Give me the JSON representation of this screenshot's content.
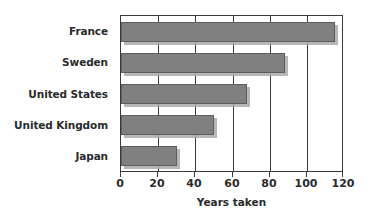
{
  "chart_data": {
    "type": "bar",
    "orientation": "horizontal",
    "title": "",
    "xlabel": "Years taken",
    "ylabel": "",
    "categories": [
      "France",
      "Sweden",
      "United States",
      "United Kingdom",
      "Japan"
    ],
    "values": [
      115,
      88,
      68,
      50,
      30
    ],
    "xlim": [
      0,
      120
    ],
    "xticks": [
      0,
      20,
      40,
      60,
      80,
      100,
      120
    ],
    "xtick_labels": [
      "0",
      "20",
      "40",
      "60",
      "80",
      "100",
      "120"
    ],
    "grid": true,
    "grid_axis": "x",
    "legend": false,
    "series": [
      {
        "name": "Years taken",
        "values": [
          115,
          88,
          68,
          50,
          30
        ]
      }
    ],
    "colors": {
      "bar_fill": "#808080",
      "bar_border": "#5d5d5d",
      "bar_shadow": "#aaaaaa",
      "axis": "#3a3a3a",
      "text": "#2b2b2b",
      "background": "#ffffff"
    }
  }
}
